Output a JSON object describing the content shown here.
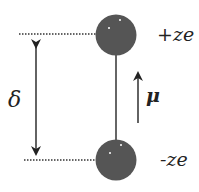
{
  "diagram": {
    "labels": {
      "top_charge": "+ze",
      "bottom_charge": "-ze",
      "separation": "δ",
      "dipole_moment": "μ"
    },
    "colors": {
      "sphere": "#555555",
      "line": "#333333",
      "text": "#222222",
      "highlight": "#ffffff",
      "background": "#ffffff"
    },
    "elements": {
      "top_sphere": {
        "cx": 116,
        "cy": 35,
        "r": 20.5
      },
      "bottom_sphere": {
        "cx": 116,
        "cy": 160,
        "r": 20.5
      },
      "rod": {
        "x": 116,
        "y1": 55,
        "y2": 140
      },
      "separation_arrow": {
        "x": 36,
        "y1": 35,
        "y2": 160
      },
      "moment_arrow": {
        "x": 138,
        "y_tail": 123,
        "y_head": 68
      },
      "top_dotted_line": {
        "y": 34,
        "x1": 19,
        "x2": 96
      },
      "bottom_dotted_line": {
        "y": 160,
        "x1": 24,
        "x2": 96
      }
    }
  }
}
